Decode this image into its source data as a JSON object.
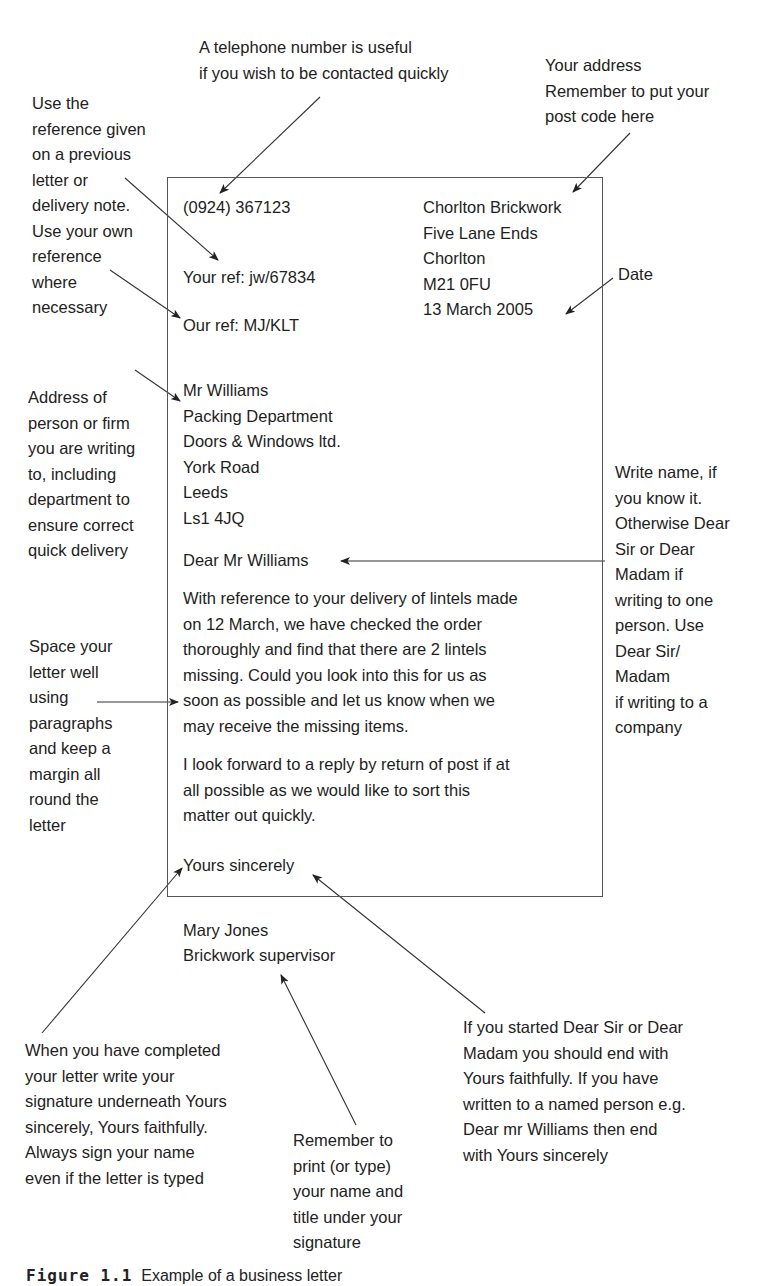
{
  "annotations": {
    "telephone": "A telephone number is useful\nif you wish to be contacted quickly",
    "your_address": "Your address\nRemember to put your\npost code here",
    "reference": "Use the\nreference given\non a previous\nletter or\ndelivery note.\nUse your own\nreference\nwhere\nnecessary",
    "date": "Date",
    "recipient_address": "Address of\nperson or firm\nyou are writing\nto, including\ndepartment to\nensure correct\nquick delivery",
    "salutation": "Write name, if\nyou know it.\nOtherwise Dear\nSir or Dear\nMadam if\nwriting to one\nperson. Use\nDear Sir/\nMadam\nif writing to a\ncompany",
    "spacing": "Space your\nletter well\nusing\nparagraphs\nand keep a\nmargin all\nround the\nletter",
    "signature": "When you have completed\nyour letter write your\nsignature underneath Yours\nsincerely, Yours faithfully.\nAlways sign your name\neven if the letter is typed",
    "print_name": "Remember to\nprint (or type)\nyour name and\ntitle under your\nsignature",
    "closing": "If you started Dear Sir or Dear\nMadam you should end with\nYours faithfully. If  you have\nwritten to a named person e.g.\nDear mr Williams then end\nwith Yours sincerely"
  },
  "letter": {
    "telephone": "(0924) 367123",
    "sender_address": "Chorlton Brickwork\nFive Lane Ends\nChorlton\nM21 0FU\n13 March 2005",
    "your_ref": "Your ref: jw/67834",
    "our_ref": "Our ref: MJ/KLT",
    "recipient_address": "Mr Williams\nPacking Department\nDoors & Windows ltd.\nYork Road\nLeeds\nLs1 4JQ",
    "salutation": "Dear Mr Williams",
    "paragraph_1": "With reference to your delivery of lintels made\non 12 March, we have checked the order\nthoroughly and find that there are 2 lintels\nmissing. Could you look into this for us as\nsoon as possible and let us know when we\nmay receive the missing items.",
    "paragraph_2": "I look forward to a reply by return of post if at\nall possible as we would like to sort this\nmatter out quickly.",
    "closing": "Yours sincerely",
    "signatory_name": "Mary Jones",
    "signatory_title": "Brickwork supervisor"
  },
  "caption": {
    "label": "Figure 1.1",
    "text": "Example of a business letter"
  }
}
